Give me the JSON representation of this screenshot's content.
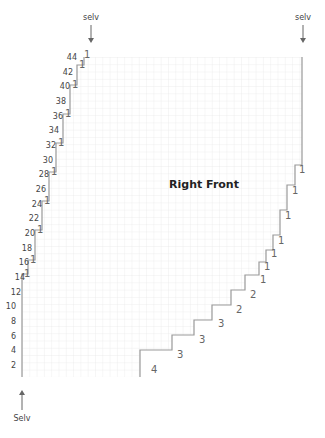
{
  "diagram": {
    "title": "Right Front",
    "selvage_labels": {
      "top_left": "selv",
      "top_right": "selv",
      "bottom_left": "Selv"
    },
    "row_labels": [
      "2",
      "4",
      "6",
      "8",
      "10",
      "12",
      "14",
      "16",
      "18",
      "20",
      "22",
      "24",
      "26",
      "28",
      "30",
      "32",
      "34",
      "36",
      "38",
      "40",
      "42",
      "44"
    ],
    "left_edge_markers": [
      "1",
      "1",
      "1",
      "1",
      "1",
      "1",
      "1",
      "1",
      "1",
      "1",
      "1"
    ],
    "right_edge_decreases": [
      "1",
      "1",
      "1",
      "1",
      "1",
      "1",
      "1",
      "2",
      "2",
      "3",
      "3",
      "3",
      "4"
    ],
    "grid": {
      "rows": 44,
      "columns": 38,
      "line_color": "#e2e2e2",
      "outline_color": "#999999"
    }
  }
}
